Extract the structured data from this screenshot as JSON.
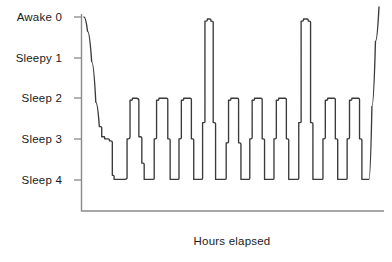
{
  "chart_data": {
    "type": "line",
    "title": "",
    "subtitle": "",
    "xlabel": "Hours elapsed",
    "ylabel": "",
    "grid": false,
    "legend": false,
    "legend_position": "none",
    "y_axis": {
      "inverted": true,
      "ylim": [
        0,
        4
      ],
      "tick_values": [
        0,
        1,
        2,
        3,
        4
      ],
      "tick_labels": [
        "Awake  0",
        "Sleepy  1",
        "Sleep  2",
        "Sleep  3",
        "Sleep  4"
      ],
      "stage_names": [
        "Awake",
        "Sleepy",
        "Sleep",
        "Sleep",
        "Sleep"
      ],
      "stage_numbers": [
        "0",
        "1",
        "2",
        "3",
        "4"
      ]
    },
    "x_axis": {
      "tick_labels": [],
      "xlim": [
        0,
        100
      ],
      "shows_ticks": false
    },
    "series": [
      {
        "name": "Sleep stage",
        "color": "#3a3a3a",
        "x": [
          0.0,
          1.2,
          2.6,
          4.0,
          5.2,
          6.0,
          6.6,
          7.0,
          7.4,
          8.6,
          9.6,
          10.2,
          10.6,
          13.2,
          14.6,
          15.6,
          16.4,
          17.0,
          18.6,
          19.6,
          20.4,
          21.0,
          23.0,
          23.8,
          24.6,
          25.4,
          27.6,
          28.4,
          29.2,
          30.0,
          31.4,
          32.2,
          33.0,
          33.8,
          35.6,
          36.4,
          37.2,
          38.0,
          39.4,
          40.2,
          41.0,
          41.8,
          43.0,
          43.8,
          44.6,
          45.4,
          47.4,
          48.2,
          49.0,
          49.8,
          51.6,
          52.4,
          53.2,
          54.0,
          55.4,
          56.2,
          57.0,
          57.8,
          59.6,
          60.4,
          61.2,
          62.0,
          63.6,
          64.4,
          65.2,
          66.0,
          67.8,
          68.6,
          69.4,
          70.2,
          72.0,
          72.8,
          73.6,
          74.4,
          76.0,
          76.8,
          77.6,
          78.4,
          80.2,
          81.0,
          81.8,
          82.6,
          84.4,
          85.2,
          86.0,
          86.8,
          88.4,
          89.2,
          90.0,
          90.8,
          92.6,
          93.4,
          94.2,
          95.0,
          96.6,
          97.6,
          98.8,
          100.0
        ],
        "stage_values": [
          0.0,
          0.35,
          1.1,
          2.1,
          2.7,
          2.95,
          2.95,
          3.0,
          3.0,
          3.05,
          3.9,
          4.0,
          4.0,
          4.0,
          3.0,
          2.05,
          2.0,
          2.0,
          2.95,
          3.6,
          4.0,
          4.0,
          4.0,
          3.0,
          2.05,
          2.0,
          2.0,
          3.0,
          4.0,
          4.0,
          4.0,
          3.0,
          2.05,
          2.0,
          2.0,
          3.0,
          4.0,
          4.0,
          4.0,
          2.6,
          0.1,
          0.05,
          0.1,
          2.6,
          4.0,
          4.0,
          4.0,
          3.1,
          2.05,
          2.0,
          2.0,
          3.1,
          4.0,
          4.0,
          4.0,
          3.0,
          2.05,
          2.0,
          2.0,
          3.0,
          4.0,
          4.0,
          4.0,
          3.0,
          2.05,
          2.0,
          2.0,
          3.0,
          4.0,
          4.0,
          4.0,
          2.6,
          0.1,
          0.05,
          0.1,
          2.6,
          4.0,
          4.0,
          4.0,
          3.0,
          2.05,
          2.0,
          2.0,
          3.0,
          4.0,
          4.0,
          4.0,
          3.0,
          2.05,
          2.0,
          2.0,
          3.0,
          4.0,
          4.0,
          4.0,
          2.2,
          0.6,
          -0.25
        ],
        "notable_features": {
          "sleep_onset_stage": 0,
          "deepest_stage": 4,
          "full_awakening_spikes": 2,
          "final_awakening": true
        }
      }
    ]
  }
}
